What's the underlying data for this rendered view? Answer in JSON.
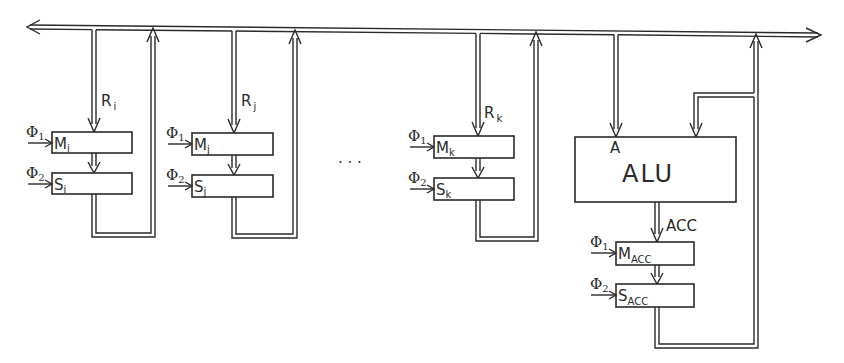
{
  "diagram": {
    "type": "register-bus-architecture",
    "bus": {
      "direction": "bidirectional",
      "left_arrow": true,
      "right_arrow": true
    },
    "modules": [
      {
        "id": "i",
        "input_label": "R",
        "input_sub": "i",
        "master": {
          "label": "M",
          "sub": "i"
        },
        "slave": {
          "label": "S",
          "sub": "i"
        },
        "clock1": {
          "label": "Φ",
          "sub": "1"
        },
        "clock2": {
          "label": "Φ",
          "sub": "2"
        }
      },
      {
        "id": "j",
        "input_label": "R",
        "input_sub": "j",
        "master": {
          "label": "M",
          "sub": "j"
        },
        "slave": {
          "label": "S",
          "sub": "j"
        },
        "clock1": {
          "label": "Φ",
          "sub": "1"
        },
        "clock2": {
          "label": "Φ",
          "sub": "2"
        }
      },
      {
        "id": "k",
        "input_label": "R",
        "input_sub": "k",
        "master": {
          "label": "M",
          "sub": "k"
        },
        "slave": {
          "label": "S",
          "sub": "k"
        },
        "clock1": {
          "label": "Φ",
          "sub": "1"
        },
        "clock2": {
          "label": "Φ",
          "sub": "2"
        }
      }
    ],
    "ellipsis": "· · ·",
    "alu": {
      "label": "ALU",
      "input_a_label": "A",
      "output_label": "ACC",
      "master": {
        "label": "M",
        "sub": "ACC"
      },
      "slave": {
        "label": "S",
        "sub": "ACC"
      },
      "clock1": {
        "label": "Φ",
        "sub": "1"
      },
      "clock2": {
        "label": "Φ",
        "sub": "2"
      }
    }
  }
}
